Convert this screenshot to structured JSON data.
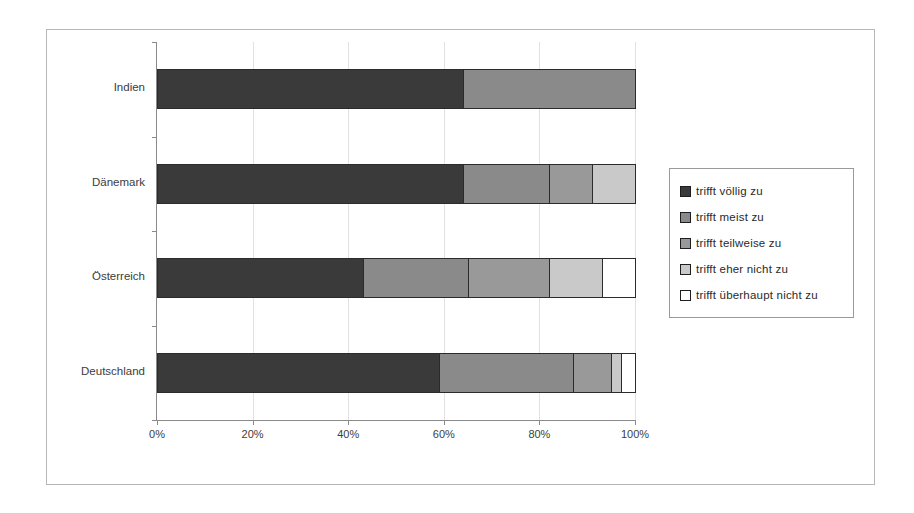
{
  "chart_data": {
    "type": "bar",
    "orientation": "horizontal",
    "stacked": true,
    "normalized_percent": true,
    "title": "",
    "subtitle": "",
    "xlabel": "",
    "ylabel": "",
    "xlim": [
      0,
      100
    ],
    "xticks": [
      0,
      20,
      40,
      60,
      80,
      100
    ],
    "xtick_labels": [
      "0%",
      "20%",
      "40%",
      "60%",
      "80%",
      "100%"
    ],
    "grid": true,
    "grid_axis": "x",
    "legend_position": "right",
    "categories": [
      "Indien",
      "Dänemark",
      "Österreich",
      "Deutschland"
    ],
    "series": [
      {
        "name": "trifft völlig zu",
        "color": "#3a3a3a",
        "values": [
          64,
          64,
          43,
          59
        ]
      },
      {
        "name": "trifft meist zu",
        "color": "#8a8a8a",
        "values": [
          36,
          18,
          22,
          28
        ]
      },
      {
        "name": "trifft teilweise zu",
        "color": "#999999",
        "values": [
          0,
          9,
          17,
          8
        ]
      },
      {
        "name": "trifft eher nicht zu",
        "color": "#c9c9c9",
        "values": [
          0,
          9,
          11,
          2
        ]
      },
      {
        "name": "trifft überhaupt nicht zu",
        "color": "#ffffff",
        "values": [
          0,
          0,
          7,
          3
        ]
      }
    ]
  },
  "legend": {
    "items": [
      {
        "label": "trifft völlig zu",
        "color": "#3a3a3a"
      },
      {
        "label": "trifft meist zu",
        "color": "#8a8a8a"
      },
      {
        "label": "trifft teilweise zu",
        "color": "#999999"
      },
      {
        "label": "trifft eher nicht zu",
        "color": "#c9c9c9"
      },
      {
        "label": "trifft überhaupt nicht zu",
        "color": "#ffffff"
      }
    ]
  },
  "axes": {
    "x_tick_labels": [
      "0%",
      "20%",
      "40%",
      "60%",
      "80%",
      "100%"
    ],
    "y_tick_labels": [
      "Indien",
      "Dänemark",
      "Österreich",
      "Deutschland"
    ]
  },
  "style": {
    "frame_color": "#b6b6b6",
    "axis_color": "#8a8a8a",
    "grid_color": "#e2e2e2",
    "segment_border": "#2b2b2b",
    "background": "#ffffff"
  }
}
